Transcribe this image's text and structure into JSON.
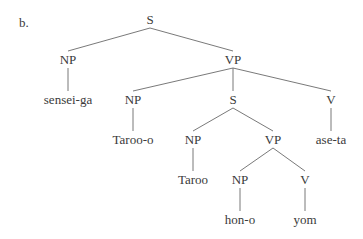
{
  "example_label": "b.",
  "tree": {
    "label": "S",
    "children": [
      {
        "label": "NP",
        "children": [
          {
            "label": "sensei-ga",
            "children": []
          }
        ]
      },
      {
        "label": "VP",
        "children": [
          {
            "label": "NP",
            "children": [
              {
                "label": "Taroo-o",
                "children": []
              }
            ]
          },
          {
            "label": "S",
            "children": [
              {
                "label": "NP",
                "children": [
                  {
                    "label": "Taroo",
                    "children": []
                  }
                ]
              },
              {
                "label": "VP",
                "children": [
                  {
                    "label": "NP",
                    "children": [
                      {
                        "label": "hon-o",
                        "children": []
                      }
                    ]
                  },
                  {
                    "label": "V",
                    "children": [
                      {
                        "label": "yom",
                        "children": []
                      }
                    ]
                  }
                ]
              }
            ]
          },
          {
            "label": "V",
            "children": [
              {
                "label": "ase-ta",
                "children": []
              }
            ]
          }
        ]
      }
    ]
  }
}
